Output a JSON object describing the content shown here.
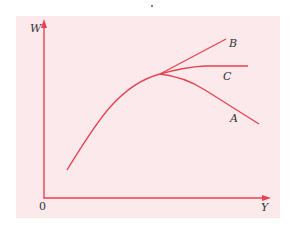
{
  "figure": {
    "background_color": "#fbe9ec",
    "curve_color": "#e8414f",
    "axis_color": "#e8414f",
    "axes": {
      "y_label": "W",
      "x_label": "Y",
      "origin_label": "0"
    },
    "curves": [
      {
        "name": "A",
        "label": "A",
        "description": "falls after peak"
      },
      {
        "name": "B",
        "label": "B",
        "description": "keeps rising after peak"
      },
      {
        "name": "C",
        "label": "C",
        "description": "levels off horizontally after peak"
      }
    ]
  }
}
